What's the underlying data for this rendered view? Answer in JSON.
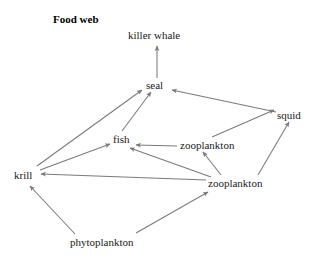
{
  "figure": {
    "title": "Food web",
    "line_color": "#7a7a7a",
    "text_color": "#1a1a1a",
    "background_color": "#ffffff"
  },
  "nodes": [
    {
      "id": "killer_whale",
      "label": "killer whale"
    },
    {
      "id": "seal",
      "label": "seal"
    },
    {
      "id": "squid",
      "label": "squid"
    },
    {
      "id": "zooplankton_upper",
      "label": "zooplankton"
    },
    {
      "id": "fish",
      "label": "fish"
    },
    {
      "id": "krill",
      "label": "krill"
    },
    {
      "id": "zooplankton_lower",
      "label": "zooplankton"
    },
    {
      "id": "phytoplankton",
      "label": "phytoplankton"
    }
  ],
  "edges": [
    {
      "from": "seal",
      "to": "killer_whale"
    },
    {
      "from": "krill",
      "to": "seal"
    },
    {
      "from": "fish",
      "to": "seal"
    },
    {
      "from": "squid",
      "to": "seal"
    },
    {
      "from": "krill",
      "to": "fish"
    },
    {
      "from": "zooplankton_upper",
      "to": "fish"
    },
    {
      "from": "zooplankton_lower",
      "to": "fish"
    },
    {
      "from": "zooplankton_upper",
      "to": "squid"
    },
    {
      "from": "zooplankton_lower",
      "to": "squid"
    },
    {
      "from": "zooplankton_lower",
      "to": "zooplankton_upper"
    },
    {
      "from": "zooplankton_lower",
      "to": "krill"
    },
    {
      "from": "phytoplankton",
      "to": "krill"
    },
    {
      "from": "phytoplankton",
      "to": "zooplankton_lower"
    }
  ]
}
